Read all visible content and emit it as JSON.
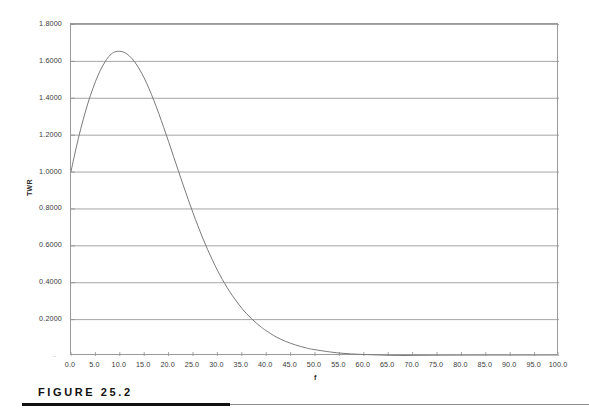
{
  "figure": {
    "caption": "FIGURE 25.2"
  },
  "chart_data": {
    "type": "line",
    "title": "",
    "subtitle": "",
    "xlabel": "f",
    "ylabel": "TWR",
    "grid": true,
    "grid_axis": "y",
    "legend": false,
    "legend_position": "none",
    "xlim": [
      0.0,
      100.0
    ],
    "ylim": [
      0.0,
      1.8
    ],
    "x_tick_labels": [
      "0.0",
      "5.0",
      "10.0",
      "15.0",
      "20.0",
      "25.0",
      "30.0",
      "35.0",
      "40.0",
      "45.0",
      "50.0",
      "55.0",
      "60.0",
      "65.0",
      "70.0",
      "75.0",
      "80.0",
      "85.0",
      "90.0",
      "95.0",
      "100.0"
    ],
    "x_ticks": [
      0,
      5,
      10,
      15,
      20,
      25,
      30,
      35,
      40,
      45,
      50,
      55,
      60,
      65,
      70,
      75,
      80,
      85,
      90,
      95,
      100
    ],
    "y_tick_labels": [
      "-",
      "0.2000",
      "0.4000",
      "0.6000",
      "0.8000",
      "1.0000",
      "1.2000",
      "1.4000",
      "1.6000",
      "1.8000"
    ],
    "y_ticks": [
      0.0,
      0.2,
      0.4,
      0.6,
      0.8,
      1.0,
      1.2,
      1.4,
      1.6,
      1.8
    ],
    "series": [
      {
        "name": "TWR",
        "color": "#7a7a7a",
        "x": [
          0,
          1,
          2,
          3,
          4,
          5,
          6,
          7,
          8,
          9,
          10,
          11,
          12,
          13,
          14,
          15,
          16,
          17,
          18,
          19,
          20,
          21,
          22,
          23,
          24,
          25,
          26,
          27,
          28,
          29,
          30,
          31,
          32,
          33,
          34,
          35,
          36,
          37,
          38,
          39,
          40,
          42,
          44,
          46,
          48,
          50,
          55,
          60,
          65,
          70,
          75,
          80,
          85,
          90,
          95,
          100
        ],
        "values": [
          1.0,
          1.122,
          1.232,
          1.329,
          1.414,
          1.487,
          1.548,
          1.596,
          1.631,
          1.649,
          1.652,
          1.645,
          1.626,
          1.596,
          1.556,
          1.507,
          1.449,
          1.384,
          1.314,
          1.239,
          1.162,
          1.083,
          1.004,
          0.926,
          0.85,
          0.776,
          0.706,
          0.639,
          0.577,
          0.519,
          0.465,
          0.416,
          0.371,
          0.33,
          0.293,
          0.259,
          0.229,
          0.202,
          0.178,
          0.156,
          0.137,
          0.104,
          0.079,
          0.06,
          0.045,
          0.034,
          0.016,
          0.008,
          0.004,
          0.002,
          0.001,
          0.0005,
          0.0003,
          0.0002,
          0.0001,
          0.0
        ]
      }
    ],
    "annotations": {
      "peak_value": 1.65,
      "peak_x": 10.0,
      "start_value": 1.0
    }
  }
}
